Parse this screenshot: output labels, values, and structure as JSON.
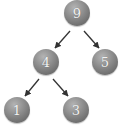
{
  "diagram": {
    "type": "binary-tree",
    "colors": {
      "node_fill": "#8a8a8a",
      "node_text": "#f2f2f2",
      "edge": "#333333",
      "background": "#ffffff"
    },
    "nodes": [
      {
        "id": "n9",
        "label": "9",
        "cx": 77,
        "cy": 13
      },
      {
        "id": "n4",
        "label": "4",
        "cx": 46,
        "cy": 62
      },
      {
        "id": "n5",
        "label": "5",
        "cx": 105,
        "cy": 62
      },
      {
        "id": "n1",
        "label": "1",
        "cx": 17,
        "cy": 110
      },
      {
        "id": "n3",
        "label": "3",
        "cx": 76,
        "cy": 110
      }
    ],
    "edges": [
      {
        "from": "9",
        "to": "4"
      },
      {
        "from": "9",
        "to": "5"
      },
      {
        "from": "4",
        "to": "1"
      },
      {
        "from": "4",
        "to": "3"
      }
    ]
  }
}
